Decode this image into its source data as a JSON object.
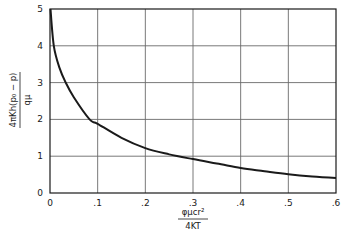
{
  "chart_data": {
    "type": "line",
    "title": "",
    "xlabel": {
      "numerator": "φμcr²",
      "denominator": "4KT"
    },
    "ylabel": {
      "numerator": "4πKh(p₀ − p)",
      "denominator": "qμ"
    },
    "xlim": [
      0,
      0.6
    ],
    "ylim": [
      0,
      5
    ],
    "x_ticks": [
      "0",
      ".1",
      ".2",
      ".3",
      ".4",
      ".5",
      ".6"
    ],
    "y_ticks": [
      "0",
      "1",
      "2",
      "3",
      "4",
      "5"
    ],
    "grid": true,
    "legend": null,
    "series": [
      {
        "name": "curve",
        "x": [
          0.001,
          0.008,
          0.02,
          0.033,
          0.05,
          0.083,
          0.1,
          0.15,
          0.2,
          0.25,
          0.3,
          0.35,
          0.4,
          0.45,
          0.5,
          0.55,
          0.6
        ],
        "y": [
          5.0,
          4.0,
          3.4,
          3.0,
          2.6,
          2.0,
          1.88,
          1.5,
          1.22,
          1.05,
          0.92,
          0.8,
          0.68,
          0.59,
          0.51,
          0.45,
          0.41
        ]
      }
    ]
  },
  "colors": {
    "line": "#1a1a1a",
    "grid": "#6a6a6a",
    "axis": "#1a1a1a"
  }
}
